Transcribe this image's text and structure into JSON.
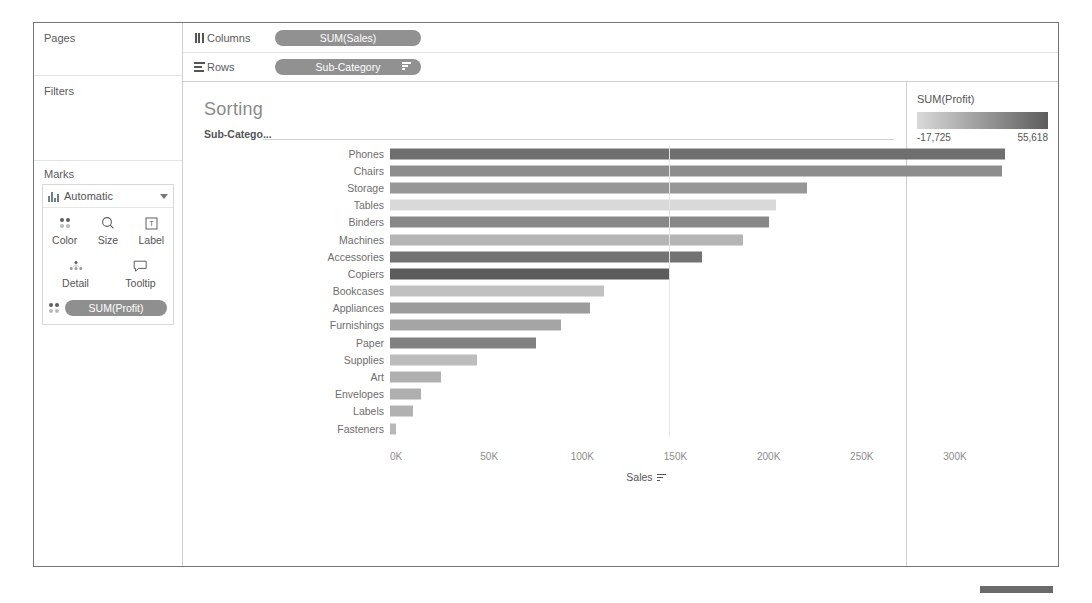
{
  "shelves": {
    "pages_label": "Pages",
    "filters_label": "Filters",
    "marks_label": "Marks",
    "columns_label": "Columns",
    "rows_label": "Rows",
    "columns_pill": "SUM(Sales)",
    "rows_pill": "Sub-Category",
    "columns_icon": "columns-bars-icon",
    "rows_icon": "rows-lines-icon",
    "rows_pill_sort_icon": "sort-descending-icon"
  },
  "marks": {
    "type_label": "Automatic",
    "type_icon": "bar-mark-icon",
    "dropdown_icon": "chevron-down-icon",
    "buttons": [
      {
        "label": "Color",
        "icon": "color-dots-icon"
      },
      {
        "label": "Size",
        "icon": "size-icon"
      },
      {
        "label": "Label",
        "icon": "label-text-icon"
      },
      {
        "label": "Detail",
        "icon": "detail-icon"
      },
      {
        "label": "Tooltip",
        "icon": "tooltip-icon"
      }
    ],
    "color_pill": "SUM(Profit)",
    "color_pill_icon": "color-dots-icon"
  },
  "worksheet": {
    "title": "Sorting",
    "row_header": "Sub-Catego...",
    "axis_title": "Sales",
    "axis_sort_icon": "sort-descending-icon"
  },
  "legend": {
    "title": "SUM(Profit)",
    "min": "-17,725",
    "max": "55,618",
    "gradient_from": "#d9d9d9",
    "gradient_to": "#5c5c5c"
  },
  "chart_data": {
    "type": "bar",
    "title": "Sorting",
    "orientation": "horizontal",
    "xlabel": "Sales",
    "ylabel": "Sub-Category",
    "xlim": [
      0,
      358000
    ],
    "grid": true,
    "gridlines_at": [
      150000
    ],
    "tick_labels": [
      "0K",
      "50K",
      "100K",
      "150K",
      "200K",
      "250K",
      "300K"
    ],
    "tick_values": [
      0,
      50000,
      100000,
      150000,
      200000,
      250000,
      300000
    ],
    "legend": {
      "title": "SUM(Profit)",
      "position": "right",
      "type": "continuous-color",
      "min": -17725,
      "max": 55618
    },
    "categories": [
      "Phones",
      "Chairs",
      "Storage",
      "Tables",
      "Binders",
      "Machines",
      "Accessories",
      "Copiers",
      "Bookcases",
      "Appliances",
      "Furnishings",
      "Paper",
      "Supplies",
      "Art",
      "Envelopes",
      "Labels",
      "Fasteners"
    ],
    "values": [
      330007,
      328449,
      223844,
      206966,
      203413,
      189239,
      167380,
      149528,
      114880,
      107532,
      91705,
      78479,
      46674,
      27119,
      16476,
      12486,
      3024
    ],
    "color_values": [
      44516,
      26590,
      21279,
      -17725,
      30222,
      3385,
      41937,
      55618,
      -3473,
      18138,
      13059,
      34054,
      -1189,
      6528,
      6964,
      5546,
      950
    ],
    "value_label": "SUM(Sales)",
    "color_label": "SUM(Profit)"
  }
}
